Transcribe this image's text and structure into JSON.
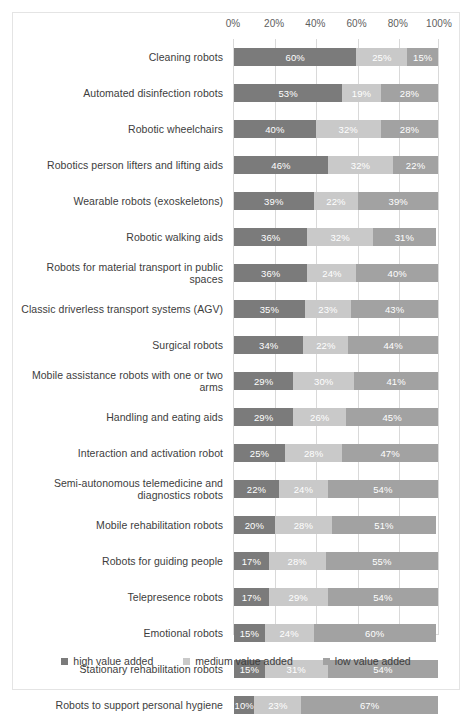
{
  "chart_data": {
    "type": "bar",
    "subtype": "100% stacked horizontal bar",
    "title": "",
    "xlabel": "",
    "ylabel": "",
    "xlim": [
      0,
      100
    ],
    "xticks": [
      "0%",
      "20%",
      "40%",
      "60%",
      "80%",
      "100%"
    ],
    "xtick_values": [
      0,
      20,
      40,
      60,
      80,
      100
    ],
    "grid": true,
    "legend_position": "bottom",
    "categories": [
      "Cleaning robots",
      "Automated disinfection robots",
      "Robotic wheelchairs",
      "Robotics person lifters and lifting aids",
      "Wearable robots (exoskeletons)",
      "Robotic walking aids",
      "Robots for material transport in public spaces",
      "Classic driverless transport systems (AGV)",
      "Surgical robots",
      "Mobile assistance robots with one or two arms",
      "Handling and eating aids",
      "Interaction and activation robot",
      "Semi-autonomous telemedicine and diagnostics robots",
      "Mobile rehabilitation robots",
      "Robots for guiding people",
      "Telepresence robots",
      "Emotional robots",
      "Stationary rehabilitation robots",
      "Robots to support personal hygiene"
    ],
    "series": [
      {
        "name": "high value added",
        "color": "#7b7b7b",
        "values": [
          60,
          53,
          40,
          46,
          39,
          36,
          36,
          35,
          34,
          29,
          29,
          25,
          22,
          20,
          17,
          17,
          15,
          15,
          10
        ],
        "labels": [
          "60%",
          "53%",
          "40%",
          "46%",
          "39%",
          "36%",
          "36%",
          "35%",
          "34%",
          "29%",
          "29%",
          "25%",
          "22%",
          "20%",
          "17%",
          "17%",
          "15%",
          "15%",
          "10%"
        ]
      },
      {
        "name": "medium value added",
        "color": "#c9c9c9",
        "values": [
          25,
          19,
          32,
          32,
          22,
          32,
          24,
          23,
          22,
          30,
          26,
          28,
          24,
          28,
          28,
          29,
          24,
          31,
          23
        ],
        "labels": [
          "25%",
          "19%",
          "32%",
          "32%",
          "22%",
          "32%",
          "24%",
          "23%",
          "22%",
          "30%",
          "26%",
          "28%",
          "24%",
          "28%",
          "28%",
          "29%",
          "24%",
          "31%",
          "23%"
        ]
      },
      {
        "name": "low value added",
        "color": "#a2a2a2",
        "values": [
          15,
          28,
          28,
          22,
          39,
          31,
          40,
          43,
          44,
          41,
          45,
          47,
          54,
          51,
          55,
          54,
          60,
          54,
          67
        ],
        "labels": [
          "15%",
          "28%",
          "28%",
          "22%",
          "39%",
          "31%",
          "40%",
          "43%",
          "44%",
          "41%",
          "45%",
          "47%",
          "54%",
          "51%",
          "55%",
          "54%",
          "60%",
          "54%",
          "67%"
        ]
      }
    ]
  },
  "legend": {
    "items": [
      {
        "label": "high value added"
      },
      {
        "label": "medium value added"
      },
      {
        "label": "low value added"
      }
    ]
  }
}
